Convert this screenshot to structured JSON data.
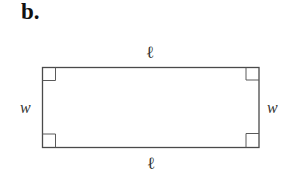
{
  "part_label": "b.",
  "figure": {
    "shape": "rectangle",
    "stroke_color": "#4a4a4a",
    "rect": {
      "x": 42.5,
      "y": 67.5,
      "width": 216.5,
      "height": 80
    },
    "right_angle_marker_size": 13,
    "labels": {
      "top": "ℓ",
      "bottom": "ℓ",
      "left": "w",
      "right": "w"
    }
  }
}
